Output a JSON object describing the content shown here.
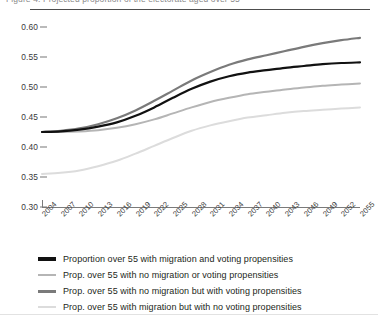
{
  "figure": {
    "title_clipped": "Figure 4: Projected proportion of the electorate aged over 55",
    "background": "#ffffff"
  },
  "chart_data": {
    "type": "line",
    "title": "",
    "xlabel": "",
    "ylabel": "",
    "ylim": [
      0.3,
      0.6
    ],
    "xlim": [
      2004,
      2055
    ],
    "grid": false,
    "legend_position": "below",
    "ytick_labels": [
      "0.60",
      "0.55",
      "0.50",
      "0.45",
      "0.40",
      "0.35",
      "0.30"
    ],
    "ytick_values": [
      0.6,
      0.55,
      0.5,
      0.45,
      0.4,
      0.35,
      0.3
    ],
    "categories": [
      "2004",
      "2007",
      "2010",
      "2013",
      "2016",
      "2019",
      "2022",
      "2025",
      "2028",
      "2031",
      "2034",
      "2037",
      "2040",
      "2043",
      "2046",
      "2049",
      "2052",
      "2055"
    ],
    "x": [
      2004,
      2007,
      2010,
      2013,
      2016,
      2019,
      2022,
      2025,
      2028,
      2031,
      2034,
      2037,
      2040,
      2043,
      2046,
      2049,
      2052,
      2055
    ],
    "series": [
      {
        "name": "Proportion over 55 with migration and voting propensities",
        "color": "#111111",
        "width": 2.2,
        "values": [
          0.425,
          0.426,
          0.429,
          0.434,
          0.441,
          0.452,
          0.466,
          0.482,
          0.497,
          0.509,
          0.518,
          0.524,
          0.528,
          0.532,
          0.535,
          0.538,
          0.54,
          0.541
        ]
      },
      {
        "name": "Prop. over 55 with no migration or voting propensities",
        "color": "#b5b5b5",
        "width": 2.0,
        "values": [
          0.425,
          0.425,
          0.426,
          0.428,
          0.432,
          0.438,
          0.446,
          0.456,
          0.466,
          0.475,
          0.482,
          0.488,
          0.492,
          0.496,
          0.499,
          0.502,
          0.504,
          0.506
        ]
      },
      {
        "name": "Prop. over 55 with no migration but with voting propensities",
        "color": "#7a7a7a",
        "width": 2.2,
        "values": [
          0.425,
          0.427,
          0.431,
          0.438,
          0.448,
          0.461,
          0.477,
          0.494,
          0.511,
          0.525,
          0.537,
          0.546,
          0.553,
          0.56,
          0.567,
          0.573,
          0.578,
          0.582
        ]
      },
      {
        "name": "Prop. over 55 with migration but with no voting propensities",
        "color": "#dcdcdc",
        "width": 2.0,
        "values": [
          0.355,
          0.357,
          0.361,
          0.368,
          0.377,
          0.389,
          0.402,
          0.415,
          0.427,
          0.436,
          0.443,
          0.449,
          0.453,
          0.457,
          0.46,
          0.462,
          0.464,
          0.466
        ]
      }
    ]
  },
  "legend": {
    "items": [
      {
        "label": "Proportion over 55 with migration and voting propensities",
        "color": "#111111"
      },
      {
        "label": "Prop. over 55 with no migration or voting propensities",
        "color": "#b5b5b5"
      },
      {
        "label": "Prop. over 55 with no migration but with voting propensities",
        "color": "#7a7a7a"
      },
      {
        "label": "Prop. over 55 with migration but with no voting propensities",
        "color": "#dcdcdc"
      }
    ]
  }
}
